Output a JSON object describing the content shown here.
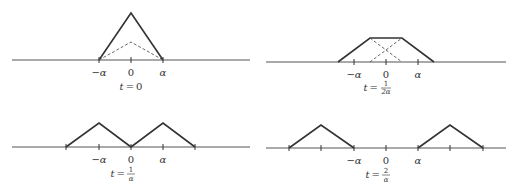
{
  "panels": [
    {
      "id": "t0",
      "caption_var": "t",
      "caption_eq": "=",
      "caption_value": "0",
      "tick_labels": {
        "neg": "−α",
        "zero": "0",
        "pos": "α"
      }
    },
    {
      "id": "t_half",
      "caption_var": "t",
      "caption_eq": "=",
      "caption_num": "1",
      "caption_den": "2α",
      "tick_labels": {
        "neg": "−α",
        "zero": "0",
        "pos": "α"
      }
    },
    {
      "id": "t_one",
      "caption_var": "t",
      "caption_eq": "=",
      "caption_num": "1",
      "caption_den": "α",
      "tick_labels": {
        "neg": "−α",
        "zero": "0",
        "pos": "α"
      }
    },
    {
      "id": "t_two",
      "caption_var": "t",
      "caption_eq": "=",
      "caption_num": "2",
      "caption_den": "α",
      "tick_labels": {
        "neg": "−α",
        "zero": "0",
        "pos": "α"
      }
    }
  ]
}
